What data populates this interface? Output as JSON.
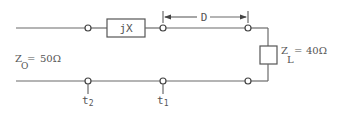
{
  "diagram": {
    "type": "transmission-line-circuit",
    "series_element": {
      "label": "jX"
    },
    "distance": {
      "label": "D"
    },
    "line_impedance": {
      "symbol": "Z",
      "subscript": "O",
      "equals": "=",
      "value": "50Ω"
    },
    "load": {
      "symbol": "Z",
      "subscript": "L",
      "equals": "=",
      "value": "40Ω"
    },
    "terminals": [
      {
        "symbol": "t",
        "subscript": "2"
      },
      {
        "symbol": "t",
        "subscript": "1"
      }
    ],
    "colors": {
      "line": "#6b6b6b",
      "text": "#555555",
      "background": "#ffffff"
    }
  }
}
